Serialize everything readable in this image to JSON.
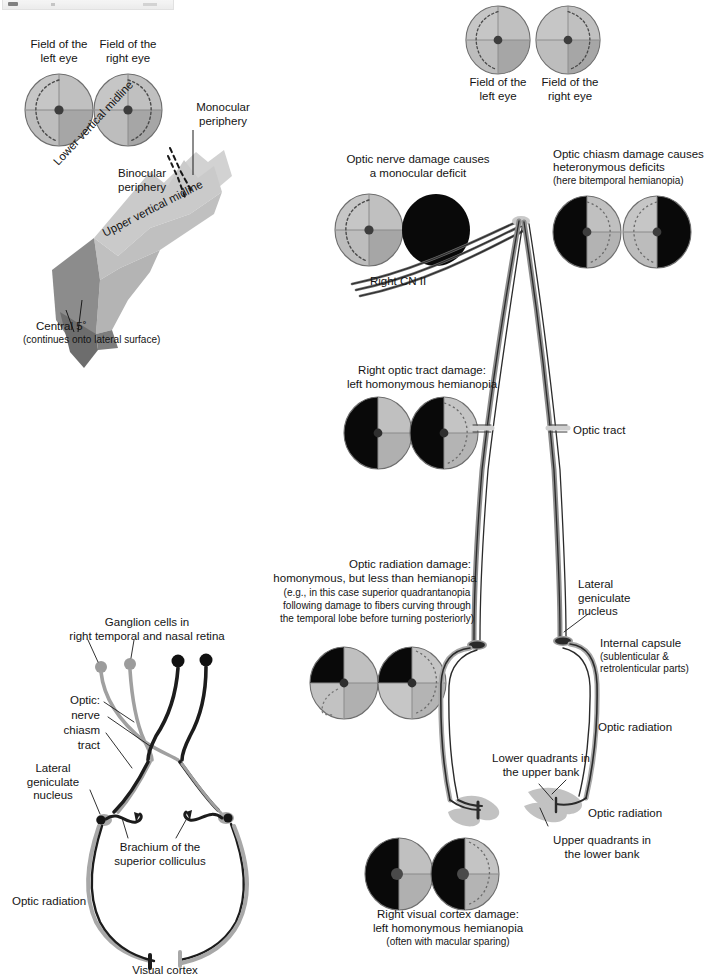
{
  "figure": {
    "top_strip_present": true
  },
  "panels": {
    "top_left_fields": {
      "left_eye_label": "Field of the\nleft eye",
      "right_eye_label": "Field of the\nright eye"
    },
    "visual_field_surface": {
      "lower_vertical_midline": "Lower vertical midline",
      "upper_vertical_midline": "Upper vertical midline",
      "binocular_periphery": "Binocular\nperiphery",
      "monocular_periphery": "Monocular\nperiphery",
      "central_5": "Central 5˚",
      "central_5_note": "(continues onto lateral surface)"
    },
    "top_right_fields": {
      "left_eye_label": "Field of the\nleft eye",
      "right_eye_label": "Field of the\nright eye"
    },
    "optic_nerve_damage": {
      "line1": "Optic nerve damage causes",
      "line2": "a monocular deficit",
      "nerve_label": "Right CN II"
    },
    "optic_chiasm_damage": {
      "line1": "Optic chiasm damage causes",
      "line2": "heteronymous deficits",
      "line3": "(here bitemporal hemianopia)"
    },
    "optic_tract_damage": {
      "line1": "Right optic tract damage:",
      "line2": "left homonymous hemianopia",
      "tract_label": "Optic tract"
    },
    "optic_radiation_damage": {
      "line1": "Optic radiation damage:",
      "line2": "homonymous, but less than hemianopia",
      "line3": "(e.g., in this case superior quadrantanopia",
      "line4": "following damage to fibers curving through",
      "line5": "the temporal lobe before turning posteriorly)"
    },
    "right_labels": {
      "lateral_geniculate_nucleus": "Lateral\ngeniculate\nnucleus",
      "internal_capsule": "Internal capsule",
      "internal_capsule_note": "(sublenticular &\nretrolenticular parts)",
      "optic_radiation_upper": "Optic radiation",
      "optic_radiation_lower": "Optic radiation",
      "lower_quadrants": "Lower quadrants in\nthe upper bank",
      "upper_quadrants": "Upper quadrants in\nthe lower bank"
    },
    "visual_cortex_damage": {
      "line1": "Right visual cortex damage:",
      "line2": "left homonymous hemianopia",
      "line3": "(often with macular sparing)"
    },
    "pathway_schematic": {
      "ganglion_cells": "Ganglion cells in\nright temporal and nasal retina",
      "optic_header": "Optic:",
      "optic_nerve": "nerve",
      "optic_chiasm": "chiasm",
      "optic_tract": "tract",
      "lateral_geniculate_nucleus": "Lateral\ngeniculate\nnucleus",
      "brachium": "Brachium of the\nsuperior colliculus",
      "optic_radiation": "Optic radiation",
      "visual_cortex": "Visual cortex"
    }
  },
  "colors": {
    "field_light": "#c9c9c9",
    "field_mid": "#b0b0b0",
    "field_dark": "#9a9a9a",
    "field_deficit": "#0a0a0a",
    "surface_light": "#d6d6d6",
    "surface_mid": "#b8b8b8",
    "surface_dark": "#8e8e8e",
    "surface_darkest": "#6f6f6f",
    "tract_dark": "#2b2b2b",
    "tract_light": "#b5b5b5",
    "text": "#141414"
  }
}
